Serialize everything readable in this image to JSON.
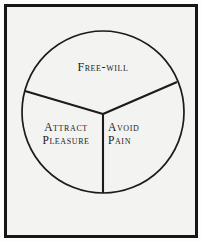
{
  "figure": {
    "background_color": "#f3f3f1",
    "ink_color": "#161616",
    "frame": {
      "name": "plate-border",
      "style": "double-rule rectangle",
      "thickness_px": 3
    },
    "circle": {
      "center_x": 103,
      "center_y": 112,
      "radius": 81,
      "stroke_color": "#1b1b1b",
      "stroke_width": 1.6,
      "fill": "none"
    },
    "dividers": [
      {
        "name": "divider-upper-left",
        "from_x": 103,
        "from_y": 114,
        "to_x": 25,
        "to_y": 91
      },
      {
        "name": "divider-upper-right",
        "from_x": 103,
        "from_y": 114,
        "to_x": 177,
        "to_y": 82
      },
      {
        "name": "divider-lower",
        "from_x": 103,
        "from_y": 114,
        "to_x": 103,
        "to_y": 193
      }
    ]
  },
  "segments": {
    "top": {
      "name": "free-will",
      "label": "Free-will"
    },
    "lower_left": {
      "name": "attract-pleasure",
      "line1": "Attract",
      "line2": "Pleasure"
    },
    "lower_right": {
      "name": "avoid-pain",
      "line1": "Avoid",
      "line2": "Pain"
    }
  }
}
